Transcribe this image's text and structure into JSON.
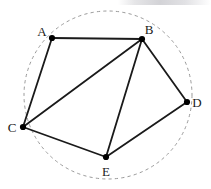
{
  "figure": {
    "width": 211,
    "height": 189,
    "background_color": "#ffffff"
  },
  "chart_data": {
    "type": "scatter",
    "title": "",
    "xlabel": "",
    "ylabel": "",
    "grid": false,
    "legend": null,
    "xlim": [
      0,
      211
    ],
    "ylim": [
      0,
      189
    ],
    "nodes": [
      {
        "id": "A",
        "label": "A",
        "x": 52,
        "y": 38,
        "label_x": 42,
        "label_y": 36
      },
      {
        "id": "B",
        "label": "B",
        "x": 142,
        "y": 39,
        "label_x": 149,
        "label_y": 34
      },
      {
        "id": "C",
        "label": "C",
        "x": 23,
        "y": 127,
        "label_x": 12,
        "label_y": 132
      },
      {
        "id": "D",
        "label": "D",
        "x": 187,
        "y": 102,
        "label_x": 197,
        "label_y": 107
      },
      {
        "id": "E",
        "label": "E",
        "x": 106,
        "y": 157,
        "label_x": 106,
        "label_y": 176
      }
    ],
    "edges": [
      {
        "from": "A",
        "to": "B"
      },
      {
        "from": "A",
        "to": "C"
      },
      {
        "from": "B",
        "to": "C"
      },
      {
        "from": "B",
        "to": "D"
      },
      {
        "from": "B",
        "to": "E"
      },
      {
        "from": "C",
        "to": "E"
      },
      {
        "from": "D",
        "to": "E"
      }
    ],
    "circle": {
      "center_x": 108,
      "center_y": 95,
      "radius": 84,
      "style": "dashed",
      "color": "#9a9a9a"
    },
    "styles": {
      "edge_color": "#1a1a1a",
      "edge_width": 1.8,
      "node_color": "#000000",
      "node_radius": 3.1,
      "label_color": "#1a1a1a",
      "label_font_size": 13
    }
  }
}
